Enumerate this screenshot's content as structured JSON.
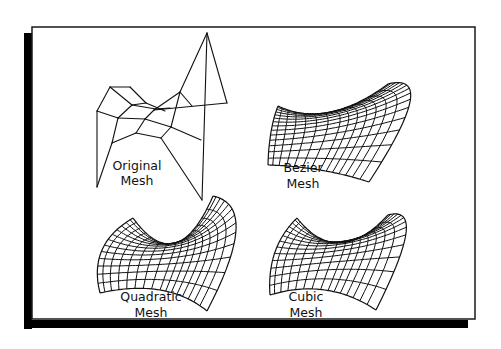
{
  "figure": {
    "frame": {
      "x": 32,
      "y": 27,
      "width": 443,
      "height": 296,
      "border_color": "#1a1a1a",
      "shadow_color": "#000000",
      "shadow_offset_x": -7,
      "shadow_offset_y": 6
    },
    "stroke_color": "#111111"
  },
  "panels": [
    {
      "id": "original",
      "labels": [
        "Original",
        "Mesh"
      ],
      "label_pos": {
        "x": 137,
        "y1": 170,
        "y2": 185
      },
      "type": "control-mesh",
      "points": [
        [
          [
            97,
            111
          ],
          [
            110,
            87
          ],
          [
            130,
            87
          ],
          [
            146,
            103
          ]
        ],
        [
          [
            97,
            111
          ],
          [
            118,
            118
          ],
          [
            131,
            106
          ],
          [
            154,
            110
          ]
        ],
        [
          [
            97,
            111
          ],
          [
            120,
            119
          ],
          [
            146,
            122
          ],
          [
            164,
            108
          ]
        ],
        [
          [
            98,
            187
          ],
          [
            113,
            143
          ],
          [
            155,
            135
          ],
          [
            186,
            117
          ]
        ],
        [
          [
            128,
            152
          ],
          [
            153,
            135
          ],
          [
            182,
            138
          ],
          [
            221,
            103
          ]
        ]
      ],
      "edges": [
        [
          [
            110,
            87
          ],
          [
            130,
            87
          ]
        ],
        [
          [
            130,
            87
          ],
          [
            146,
            103
          ]
        ],
        [
          [
            110,
            87
          ],
          [
            97,
            111
          ]
        ],
        [
          [
            110,
            87
          ],
          [
            132,
            105
          ]
        ],
        [
          [
            132,
            105
          ],
          [
            146,
            103
          ]
        ],
        [
          [
            146,
            103
          ],
          [
            165,
            111
          ]
        ],
        [
          [
            132,
            105
          ],
          [
            118,
            118
          ]
        ],
        [
          [
            97,
            111
          ],
          [
            118,
            118
          ]
        ],
        [
          [
            118,
            118
          ],
          [
            145,
            119
          ]
        ],
        [
          [
            132,
            105
          ],
          [
            156,
            109
          ]
        ],
        [
          [
            156,
            109
          ],
          [
            170,
            108
          ]
        ],
        [
          [
            97,
            111
          ],
          [
            97,
            187
          ]
        ],
        [
          [
            118,
            118
          ],
          [
            112,
            143
          ]
        ],
        [
          [
            145,
            119
          ],
          [
            136,
            133
          ]
        ],
        [
          [
            136,
            133
          ],
          [
            112,
            143
          ]
        ],
        [
          [
            145,
            119
          ],
          [
            154,
            110
          ]
        ],
        [
          [
            154,
            110
          ],
          [
            180,
            92
          ]
        ],
        [
          [
            145,
            119
          ],
          [
            171,
            127
          ]
        ],
        [
          [
            171,
            127
          ],
          [
            161,
            138
          ]
        ],
        [
          [
            161,
            138
          ],
          [
            136,
            133
          ]
        ],
        [
          [
            171,
            127
          ],
          [
            180,
            92
          ]
        ],
        [
          [
            180,
            92
          ],
          [
            192,
            106
          ]
        ],
        [
          [
            154,
            110
          ],
          [
            227,
            103
          ]
        ],
        [
          [
            207,
            33
          ],
          [
            180,
            92
          ]
        ],
        [
          [
            207,
            33
          ],
          [
            227,
            103
          ]
        ],
        [
          [
            207,
            33
          ],
          [
            202,
            200
          ]
        ],
        [
          [
            171,
            127
          ],
          [
            201,
            140
          ]
        ],
        [
          [
            161,
            138
          ],
          [
            202,
            200
          ]
        ],
        [
          [
            112,
            143
          ],
          [
            97,
            187
          ]
        ]
      ]
    },
    {
      "id": "bezier",
      "labels": [
        "Bezier",
        "Mesh"
      ],
      "label_pos": {
        "x": 303,
        "y1": 172,
        "y2": 188
      },
      "type": "surface",
      "corners": {
        "tl": [
          278,
          106
        ],
        "tr": [
          388,
          84
        ],
        "br": [
          369,
          182
        ],
        "bl": [
          268,
          165
        ]
      },
      "ctrl": {
        "top_mid": [
          330,
          112
        ],
        "bottom_mid": [
          320,
          150
        ],
        "right_tip": [
          405,
          107
        ],
        "left_mid": [
          271,
          132
        ]
      },
      "grid": {
        "u": 14,
        "v": 14
      }
    },
    {
      "id": "quadratic",
      "labels": [
        "Quadratic",
        "Mesh"
      ],
      "label_pos": {
        "x": 151,
        "y1": 301,
        "y2": 317
      },
      "type": "surface",
      "corners": {
        "tl": [
          133,
          218
        ],
        "tr": [
          213,
          196
        ],
        "br": [
          207,
          311
        ],
        "bl": [
          100,
          293
        ]
      },
      "ctrl": {
        "top_mid": [
          175,
          243
        ],
        "bottom_mid": [
          160,
          270
        ],
        "right_tip": [
          231,
          235
        ],
        "left_mid": [
          102,
          250
        ]
      },
      "grid": {
        "u": 16,
        "v": 13
      }
    },
    {
      "id": "cubic",
      "labels": [
        "Cubic",
        "Mesh"
      ],
      "label_pos": {
        "x": 306,
        "y1": 301,
        "y2": 317
      },
      "type": "surface",
      "corners": {
        "tl": [
          297,
          218
        ],
        "tr": [
          388,
          215
        ],
        "br": [
          376,
          310
        ],
        "bl": [
          270,
          295
        ]
      },
      "ctrl": {
        "top_mid": [
          340,
          243
        ],
        "bottom_mid": [
          325,
          270
        ],
        "right_tip": [
          401,
          238
        ],
        "left_mid": [
          275,
          252
        ]
      },
      "grid": {
        "u": 15,
        "v": 13
      }
    }
  ]
}
